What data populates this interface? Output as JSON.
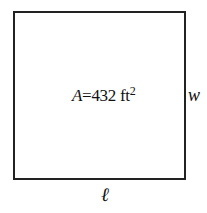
{
  "diagram": {
    "shape": "rectangle",
    "area_label": {
      "variable": "A",
      "equals": "=",
      "value": "432",
      "unit": "ft",
      "exponent": "2"
    },
    "width_label": "w",
    "length_label": "ℓ"
  }
}
